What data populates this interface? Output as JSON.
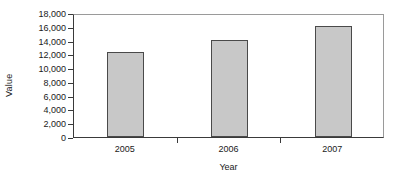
{
  "chart_data": {
    "type": "bar",
    "title": "",
    "subtitle": "",
    "xlabel": "Year",
    "ylabel": "Value",
    "categories": [
      "2005",
      "2006",
      "2007"
    ],
    "values": [
      12300,
      14050,
      16150
    ],
    "series": [
      {
        "name": "Value",
        "values": [
          12300,
          14050,
          16150
        ]
      }
    ],
    "ylim": [
      0,
      18000
    ],
    "y_tick_values": [
      0,
      2000,
      4000,
      6000,
      8000,
      10000,
      12000,
      14000,
      16000,
      18000
    ],
    "y_tick_labels": [
      "18,000",
      "16,000",
      "14,000",
      "12,000",
      "10,000",
      "8,000",
      "6,000",
      "4,000",
      "2,000",
      "0"
    ],
    "grid": false,
    "legend": false,
    "legend_position": "none",
    "annotations": [],
    "colors": {
      "bar_fill": "#c8c8c8",
      "bar_border": "#4a4a4a",
      "axis": "#3a3a3a",
      "frame": "#9a9a9a",
      "text": "#1a1a1a",
      "background": "#ffffff"
    }
  }
}
